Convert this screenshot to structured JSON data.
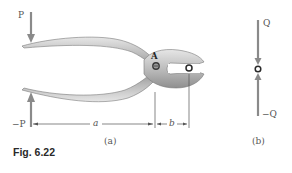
{
  "figure": {
    "caption": "Fig. 6.22",
    "panel_a": {
      "sublabel": "(a)",
      "force_top": "P",
      "force_bottom": "−P",
      "pivot_label": "A",
      "dimension_a": "a",
      "dimension_b": "b"
    },
    "panel_b": {
      "sublabel": "(b)",
      "force_top": "Q",
      "force_bottom": "−Q"
    },
    "colors": {
      "arrow": "#8a8a8a",
      "pliers_fill": "#c4c4c4",
      "pliers_edge": "#7a7a7a",
      "dimension": "#555555",
      "pin": "#2a2a2a"
    }
  }
}
